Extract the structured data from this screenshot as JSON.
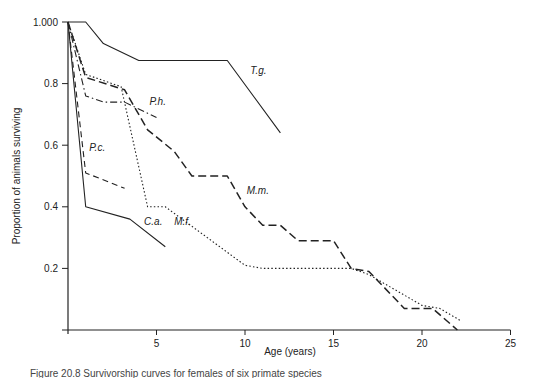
{
  "chart_data": {
    "type": "line",
    "title": "",
    "xlabel": "Age (years)",
    "ylabel": "Proportion of animals surviving",
    "xlim": [
      0,
      25
    ],
    "ylim": [
      0,
      1.0
    ],
    "x_ticks": [
      5,
      10,
      15,
      20,
      25
    ],
    "x_tick_labels": [
      "5",
      "10",
      "15",
      "20",
      "25"
    ],
    "y_ticks": [
      0.2,
      0.4,
      0.6,
      0.8,
      1.0
    ],
    "y_tick_labels": [
      "0.2",
      "0.4",
      "0.6",
      "0.8",
      "1.000"
    ],
    "grid": false,
    "legend": "inline labels",
    "series": [
      {
        "name": "T.g.",
        "style": "solid",
        "label_pos": [
          10.3,
          0.83
        ],
        "x": [
          0,
          1,
          2,
          4,
          9,
          12
        ],
        "y": [
          1.0,
          1.0,
          0.93,
          0.875,
          0.875,
          0.64
        ]
      },
      {
        "name": "C.a.",
        "style": "solid",
        "label_pos": [
          4.3,
          0.34
        ],
        "x": [
          0,
          1,
          3.5,
          5.5
        ],
        "y": [
          1.0,
          0.4,
          0.36,
          0.27
        ]
      },
      {
        "name": "P.c.",
        "style": "dashed",
        "label_pos": [
          1.2,
          0.58
        ],
        "x": [
          0,
          1,
          3.2
        ],
        "y": [
          1.0,
          0.51,
          0.46
        ]
      },
      {
        "name": "P.h.",
        "style": "dashdot",
        "label_pos": [
          4.6,
          0.73
        ],
        "x": [
          0,
          1,
          2,
          3.2,
          5
        ],
        "y": [
          1.0,
          0.76,
          0.74,
          0.74,
          0.69
        ]
      },
      {
        "name": "M.m.",
        "style": "longdash",
        "label_pos": [
          10.1,
          0.44
        ],
        "x": [
          0,
          1,
          3.2,
          4.5,
          6,
          7,
          9,
          10,
          11,
          12,
          13,
          15,
          16,
          17,
          19,
          20.6,
          22
        ],
        "y": [
          1.0,
          0.82,
          0.78,
          0.65,
          0.58,
          0.5,
          0.5,
          0.4,
          0.34,
          0.34,
          0.29,
          0.29,
          0.2,
          0.19,
          0.07,
          0.07,
          0.0
        ]
      },
      {
        "name": "M.f.",
        "style": "dotted",
        "label_pos": [
          6.0,
          0.34
        ],
        "x": [
          0,
          1,
          3,
          4.5,
          5.5,
          10,
          11,
          16,
          17,
          20,
          21,
          22.2
        ],
        "y": [
          1.0,
          0.83,
          0.79,
          0.4,
          0.4,
          0.21,
          0.2,
          0.2,
          0.18,
          0.08,
          0.07,
          0.03
        ]
      }
    ]
  },
  "caption": "Figure 20.8 Survivorship curves for females of six primate species"
}
